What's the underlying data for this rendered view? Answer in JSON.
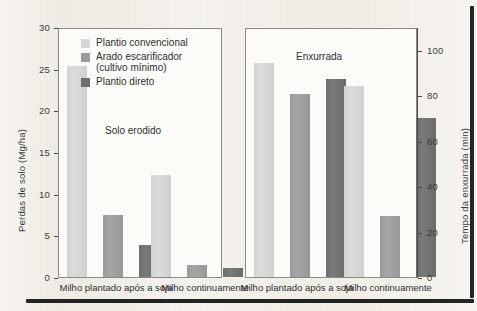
{
  "figure": {
    "background_color": "#efebe4",
    "edge_rule_color": "#232323"
  },
  "legend": {
    "items": [
      {
        "label": "Plantio convencional",
        "color": "#d6d6d4"
      },
      {
        "label": "Arado escarificador\n(cultivo mínimo)",
        "line1": "Arado escarificador",
        "line2": "(cultivo mínimo)",
        "color": "#9c9c9a"
      },
      {
        "label": "Plantio direto",
        "color": "#6e6e6c"
      }
    ]
  },
  "chart_data": [
    {
      "type": "bar",
      "id": "solo-erodido",
      "title": "Solo erodido",
      "xlabel": "",
      "ylabel": "Perdas de solo (Mg/ha)",
      "ylim": [
        0,
        30
      ],
      "yticks": [
        0,
        5,
        10,
        15,
        20,
        25,
        30
      ],
      "ytick_labels": [
        "0",
        "5",
        "10",
        "15",
        "20",
        "25",
        "30"
      ],
      "y_axis_position": "left",
      "grid": false,
      "legend_position": "inside-top-center",
      "categories": [
        "Milho plantado após a soja",
        "Milho continuamente"
      ],
      "series": [
        {
          "name": "Plantio convencional",
          "color": "#d6d6d4",
          "values": [
            25.3,
            12.3
          ]
        },
        {
          "name": "Arado escarificador (cultivo mínimo)",
          "color": "#9c9c9a",
          "values": [
            7.4,
            1.5
          ]
        },
        {
          "name": "Plantio direto",
          "color": "#6e6e6c",
          "values": [
            3.9,
            1.1
          ]
        }
      ]
    },
    {
      "type": "bar",
      "id": "enxurrada",
      "title": "Enxurrada",
      "xlabel": "",
      "ylabel": "Tempo da enxurrada (min)",
      "ylim": [
        0,
        110
      ],
      "yticks": [
        0,
        20,
        40,
        60,
        80,
        100
      ],
      "ytick_labels": [
        "0",
        "20",
        "40",
        "60",
        "80",
        "100"
      ],
      "y_axis_position": "right",
      "grid": false,
      "legend_position": "none",
      "categories": [
        "Milho plantado após a soja",
        "Milho continuamente"
      ],
      "series": [
        {
          "name": "Plantio convencional",
          "color": "#d6d6d4",
          "values": [
            94,
            84
          ]
        },
        {
          "name": "Arado escarificador (cultivo mínimo)",
          "color": "#9c9c9a",
          "values": [
            80.5,
            27
          ]
        },
        {
          "name": "Plantio direto",
          "color": "#6e6e6c",
          "values": [
            87,
            70
          ]
        }
      ]
    }
  ]
}
